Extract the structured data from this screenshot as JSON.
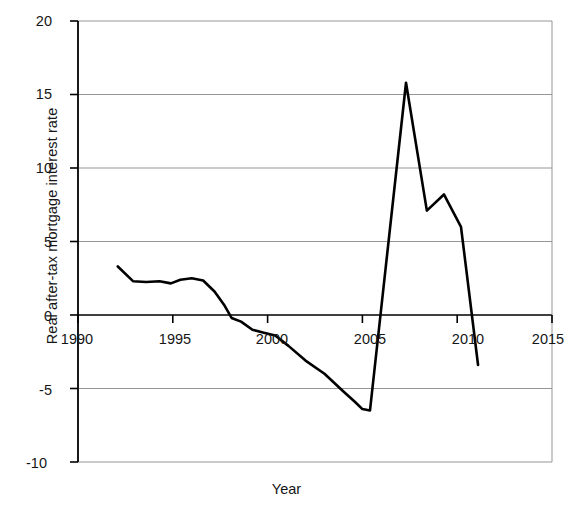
{
  "chart_data": {
    "type": "line",
    "title": "",
    "xlabel": "Year",
    "ylabel": "Real after-tax mortgage interest rate",
    "xlim": [
      1990,
      2015
    ],
    "ylim": [
      -10,
      20
    ],
    "xticks": [
      1990,
      1995,
      2000,
      2005,
      2010,
      2015
    ],
    "xtick_labels": [
      "1990",
      "1995",
      "2000",
      "2005",
      "2010",
      "2015"
    ],
    "yticks": [
      20,
      15,
      10,
      5,
      0,
      -5,
      -10
    ],
    "ytick_labels": [
      "20",
      "15",
      "10",
      "5",
      "0",
      "-5",
      "-10"
    ],
    "grid": "horizontal",
    "legend": "none",
    "line_color": "#000000",
    "line_width": 2.6,
    "series": [
      {
        "name": "Real after-tax mortgage interest rate",
        "x": [
          1992.1,
          1992.9,
          1993.6,
          1994.3,
          1994.9,
          1995.4,
          1996.0,
          1996.6,
          1997.2,
          1997.7,
          1998.1,
          1998.6,
          1999.2,
          1999.8,
          2000.4,
          2001.1,
          2002.0,
          2003.0,
          2004.0,
          2004.6,
          2005.0,
          2005.4,
          2007.3,
          2008.4,
          2009.3,
          2010.2,
          2011.1
        ],
        "y": [
          3.3,
          2.3,
          2.25,
          2.3,
          2.15,
          2.4,
          2.5,
          2.35,
          1.6,
          0.7,
          -0.2,
          -0.45,
          -1.0,
          -1.2,
          -1.4,
          -2.1,
          -3.1,
          -4.0,
          -5.2,
          -5.9,
          -6.4,
          -6.5,
          15.8,
          7.1,
          8.2,
          6.0,
          -3.4
        ]
      }
    ]
  },
  "axes": {
    "ylabel_name": "Real after-tax mortgage interest rate",
    "xlabel_name": "Year"
  }
}
